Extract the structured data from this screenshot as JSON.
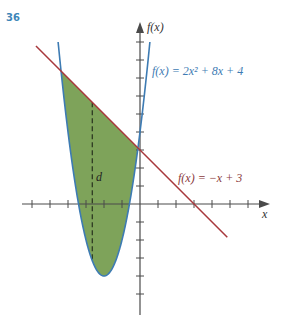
{
  "problem_number": "36",
  "colors": {
    "axis": "#4a4a4a",
    "parabola": "#3d7bb3",
    "line": "#a8383c",
    "fill": "#7ea35a",
    "label_parabola": "#3d7bb3",
    "label_line": "#8a3a3c",
    "problem_number": "#3d86b8"
  },
  "axes": {
    "x_label": "x",
    "y_label": "f(x)"
  },
  "labels": {
    "parabola": "f(x) = 2x² + 8x + 4",
    "line": "f(x) = −x + 3",
    "distance": "d"
  },
  "chart_data": {
    "type": "line",
    "title": "",
    "xlabel": "x",
    "ylabel": "f(x)",
    "xlim": [
      -7.5,
      7.2
    ],
    "ylim": [
      -5.5,
      9
    ],
    "grid": false,
    "x_ticks": [
      -6,
      -5,
      -4,
      -3,
      -2,
      -1,
      1,
      2,
      3,
      4,
      5,
      6
    ],
    "y_ticks": [
      -5,
      -4,
      -3,
      -2,
      -1,
      1,
      2,
      3,
      4,
      5,
      6,
      7,
      8,
      9
    ],
    "series": [
      {
        "name": "f(x) = 2x^2 + 8x + 4",
        "kind": "parabola",
        "coefficients": [
          2,
          8,
          4
        ],
        "color": "#3d7bb3",
        "vertex": [
          -2,
          -4
        ]
      },
      {
        "name": "f(x) = -x + 3",
        "kind": "line",
        "slope": -1,
        "intercept": 3,
        "color": "#a8383c"
      }
    ],
    "shaded_region": {
      "between": [
        "f(x) = -x + 3",
        "f(x) = 2x^2 + 8x + 4"
      ],
      "x_from": -4.386,
      "x_to": -0.114,
      "color": "#7ea35a"
    },
    "intersections": [
      [
        -4.386,
        7.386
      ],
      [
        -0.114,
        3.114
      ]
    ],
    "annotations": [
      {
        "text": "d",
        "type": "dashed vertical segment",
        "x": -2.65
      }
    ]
  }
}
